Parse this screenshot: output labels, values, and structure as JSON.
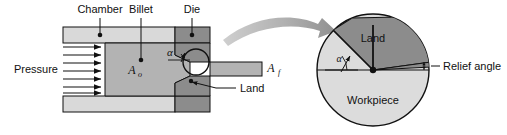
{
  "figure": {
    "background_color": "#ffffff",
    "width": 507,
    "height": 135
  },
  "colors": {
    "chamber_fill": "#d9d9d9",
    "billet_fill": "#b3b3b3",
    "die_fill": "#8c8c8c",
    "workpiece_fill": "#dcdcdc",
    "land_fill": "#8c8c8c",
    "outline": "#111111",
    "arrow_gray": "#a8a8a8",
    "text": "#111111"
  },
  "left_diagram": {
    "name": "extrusion-cross-section",
    "labels": {
      "chamber": "Chamber",
      "billet": "Billet",
      "die": "Die",
      "pressure": "Pressure",
      "land": "Land",
      "area_initial": "A",
      "area_initial_sub": "o",
      "area_final": "A",
      "area_final_sub": "f",
      "die_angle": "α"
    },
    "pressure_arrow_count": 7
  },
  "detail_inset": {
    "name": "die-detail-circle",
    "labels": {
      "land": "Land",
      "workpiece": "Workpiece",
      "relief_angle": "Relief angle",
      "die_angle": "α"
    }
  },
  "connector": {
    "name": "detail-callout-arrow",
    "style": "curved-gray-arrow"
  }
}
